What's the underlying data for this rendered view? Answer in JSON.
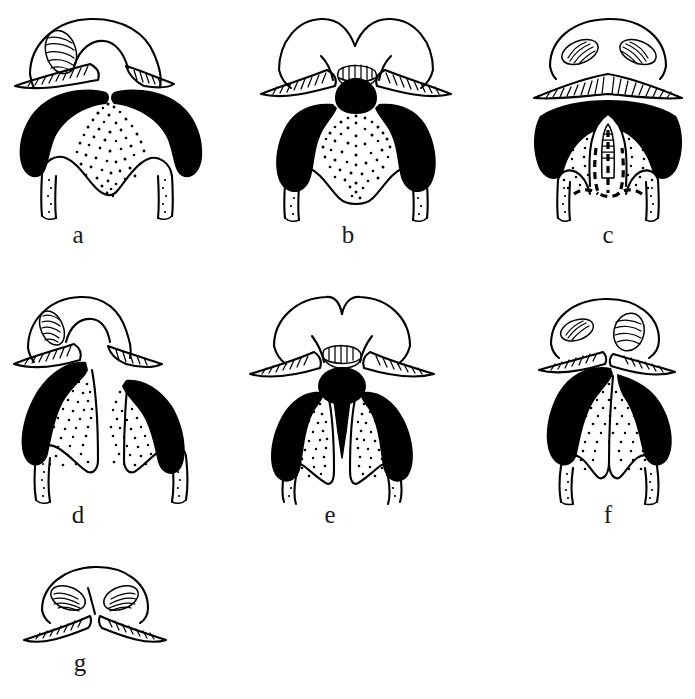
{
  "figure": {
    "type": "scientific-line-drawing-plate",
    "background_color": "#ffffff",
    "ink_color": "#000000",
    "panel_count": 7,
    "caption_font_style": "serif-lowercase-italicless"
  },
  "panels": [
    {
      "id": "a",
      "label": "a",
      "row": 1,
      "column": 1,
      "label_x": 78,
      "label_y": 234,
      "box": {
        "x": 8,
        "y": 8,
        "w": 215,
        "h": 215
      },
      "features": {
        "head_shield": "broad rounded hood with single visible oval eye on left",
        "eye_count": 1,
        "mandibular_plates": "two solid black crescent lobes meeting at midline notch",
        "stipple_region": "central triangular stippled clypeus",
        "rostrum": "short two-lobed labium with stippled inner edges",
        "midline_structure": "none"
      }
    },
    {
      "id": "b",
      "label": "b",
      "row": 1,
      "column": 2,
      "label_x": 348,
      "label_y": 234,
      "box": {
        "x": 255,
        "y": 8,
        "w": 210,
        "h": 215
      },
      "features": {
        "head_shield": "twin-lobed hood with central notch and hatched mouth opening",
        "eye_count": 0,
        "mandibular_plates": "two solid black vertical lobes plus central black rounded block",
        "stipple_region": "broad central stippled band widening downward",
        "rostrum": "short two-lobed labium",
        "midline_structure": "solid black median plate"
      }
    },
    {
      "id": "c",
      "label": "c",
      "row": 1,
      "column": 3,
      "label_x": 608,
      "label_y": 234,
      "box": {
        "x": 528,
        "y": 8,
        "w": 160,
        "h": 215
      },
      "features": {
        "head_shield": "low wide hood with two oblique hatched oval eyes",
        "eye_count": 2,
        "mandibular_plates": "single broad solid black arch spanning full width",
        "stipple_region": "stippled field flanking a pale median tongue",
        "rostrum": "long parallel-sided labium",
        "midline_structure": "pale median stylet outlined, with dashed internal outline below"
      }
    },
    {
      "id": "d",
      "label": "d",
      "row": 2,
      "column": 1,
      "label_x": 78,
      "label_y": 514,
      "box": {
        "x": 8,
        "y": 288,
        "w": 205,
        "h": 215
      },
      "features": {
        "head_shield": "asymmetric hood with one hatched oval eye at left",
        "eye_count": 1,
        "mandibular_plates": "two offset solid black elongate lobes, left higher than right",
        "stipple_region": "two separate elongate stippled lobes",
        "rostrum": "long divergent two-pronged labium",
        "midline_structure": "deep median cleft"
      }
    },
    {
      "id": "e",
      "label": "e",
      "row": 2,
      "column": 2,
      "label_x": 330,
      "label_y": 514,
      "box": {
        "x": 240,
        "y": 288,
        "w": 205,
        "h": 215
      },
      "features": {
        "head_shield": "domed hood with central hatched mouth opening",
        "eye_count": 0,
        "mandibular_plates": "two solid black elongate lobes flanking midline",
        "stipple_region": "two elongate stippled lobes inside the black plates",
        "rostrum": "long divergent two-pronged labium",
        "midline_structure": "solid black median disc drawn out into a long tapering spike"
      }
    },
    {
      "id": "f",
      "label": "f",
      "row": 2,
      "column": 3,
      "label_x": 608,
      "label_y": 514,
      "box": {
        "x": 525,
        "y": 288,
        "w": 165,
        "h": 215
      },
      "features": {
        "head_shield": "small hood set high with two hatched oval eyes",
        "eye_count": 2,
        "mandibular_plates": "two broad solid black crescents converging at midline",
        "stipple_region": "wide stippled field split by a median ridge",
        "rostrum": "four-lobed scalloped labium margin",
        "midline_structure": "median ridge line"
      }
    },
    {
      "id": "g",
      "label": "g",
      "row": 3,
      "column": 1,
      "label_x": 80,
      "label_y": 662,
      "box": {
        "x": 20,
        "y": 558,
        "w": 150,
        "h": 95
      },
      "features": {
        "head_shield": "small triangular hood with two hatched oval eyes",
        "eye_count": 2,
        "mandibular_plates": "none shown",
        "stipple_region": "none",
        "rostrum": "pair of long hatched lateral blades meeting at a central point",
        "midline_structure": "central apex point"
      }
    }
  ]
}
